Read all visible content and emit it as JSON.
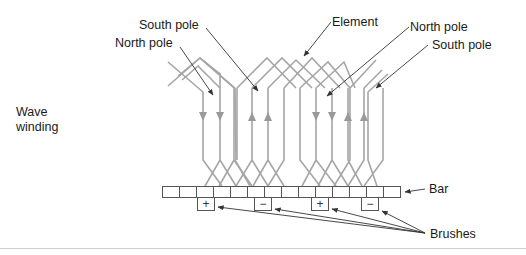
{
  "diagram": {
    "side_label_line1": "Wave",
    "side_label_line2": "winding",
    "labels": {
      "south_pole_left": "South pole",
      "north_pole_left": "North pole",
      "element": "Element",
      "north_pole_right": "North pole",
      "south_pole_right": "South pole",
      "bar": "Bar",
      "brushes": "Brushes"
    },
    "commutator": {
      "segment_count": 16,
      "brushes": [
        {
          "symbol": "+",
          "segment": 2
        },
        {
          "symbol": "−",
          "segment": 5
        },
        {
          "symbol": "+",
          "segment": 9
        },
        {
          "symbol": "−",
          "segment": 12
        }
      ]
    },
    "colors": {
      "winding": "#a6a6a6",
      "arrowhead": "#9a9a9a",
      "leader": "#333333",
      "outline": "#555555",
      "divider": "#cfcfcf"
    }
  }
}
